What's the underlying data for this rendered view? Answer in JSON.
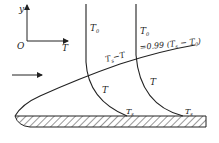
{
  "diagram": {
    "type": "thermal boundary layer over flat plate",
    "axes": {
      "origin_label": "O",
      "y_label": "y",
      "x_label": "T"
    },
    "profiles": [
      {
        "id": "profile-1",
        "top_label": "T0",
        "top_label_base": "T",
        "top_label_sub": "0",
        "mid_label": "T",
        "wall_label": "Ts",
        "wall_label_base": "T",
        "wall_label_sub": "s"
      },
      {
        "id": "profile-2",
        "top_label": "T0",
        "top_label_base": "T",
        "top_label_sub": "0",
        "mid_label": "T",
        "wall_label": "Ts",
        "wall_label_base": "T",
        "wall_label_sub": "s"
      }
    ],
    "boundary_layer_label": {
      "text": "Ts−T",
      "base": "T",
      "sub": "s",
      "rest": "−T"
    },
    "edge_condition": {
      "text": "=0.99 (Ts − T0)",
      "prefix": "=0.99 (",
      "t1": "T",
      "t1_sub": "s",
      "minus": " − ",
      "t2": "T",
      "t2_sub": "0",
      "suffix": ")"
    },
    "flow_arrow": "free-stream flow direction",
    "colors": {
      "line": "#222222",
      "background": "#ffffff"
    }
  }
}
